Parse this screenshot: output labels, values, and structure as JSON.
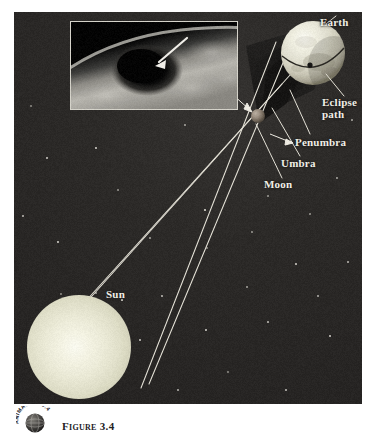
{
  "figure": {
    "domain": "diagram",
    "background_color": "#2a2826",
    "page_color": "#ffffff"
  },
  "labels": [
    {
      "id": "earth",
      "text": "Earth",
      "x": 320,
      "y": 16,
      "align": "left"
    },
    {
      "id": "eclipse_path",
      "text": "Eclipse\npath",
      "x": 322,
      "y": 96,
      "align": "left"
    },
    {
      "id": "penumbra",
      "text": "Penumbra",
      "x": 295,
      "y": 136,
      "align": "left"
    },
    {
      "id": "umbra",
      "text": "Umbra",
      "x": 281,
      "y": 157,
      "align": "left"
    },
    {
      "id": "moon",
      "text": "Moon",
      "x": 264,
      "y": 178,
      "align": "left"
    },
    {
      "id": "sun",
      "text": "Sun",
      "x": 106,
      "y": 288,
      "align": "left"
    }
  ],
  "bodies": {
    "sun": {
      "name": "Sun",
      "cx": 79,
      "cy": 347,
      "r": 52,
      "color": "#eeedd8"
    },
    "moon": {
      "name": "Moon",
      "cx": 258,
      "cy": 116,
      "r": 7,
      "color": "#8b7f71"
    },
    "earth": {
      "name": "Earth",
      "cx": 313,
      "cy": 53,
      "r": 32,
      "color": "#e6e4d5"
    }
  },
  "shadow": {
    "umbra_label": "Umbra",
    "penumbra_label": "Penumbra",
    "eclipse_path_label": "Eclipse path",
    "cone_color": "#1b1a19",
    "ray_color": "#e8e5da",
    "ray_count": 4
  },
  "inset": {
    "name": "satellite-photo-of-umbral-shadow-on-earth",
    "caption_arrow": "white arrow pointing to the dark umbral shadow spot",
    "border_color": "#d8d6cd",
    "x": 70,
    "y": 21,
    "width": 168,
    "height": 89
  },
  "badge": {
    "text_top": "ANIMATION",
    "text_number": "3.4",
    "full_text": "ANIMATION 3.4"
  },
  "caption": {
    "figure_number": "Figure 3.4",
    "text": "Figure 3.4"
  },
  "stars": [
    {
      "x": 31,
      "y": 106,
      "r": 1.1
    },
    {
      "x": 185,
      "y": 125,
      "r": 1.0
    },
    {
      "x": 23,
      "y": 216,
      "r": 1.2
    },
    {
      "x": 58,
      "y": 242,
      "r": 0.9
    },
    {
      "x": 118,
      "y": 190,
      "r": 0.8
    },
    {
      "x": 150,
      "y": 238,
      "r": 1.0
    },
    {
      "x": 162,
      "y": 296,
      "r": 0.9
    },
    {
      "x": 205,
      "y": 210,
      "r": 0.8
    },
    {
      "x": 207,
      "y": 248,
      "r": 1.0
    },
    {
      "x": 247,
      "y": 287,
      "r": 1.1
    },
    {
      "x": 268,
      "y": 322,
      "r": 0.9
    },
    {
      "x": 296,
      "y": 264,
      "r": 1.0
    },
    {
      "x": 310,
      "y": 214,
      "r": 0.8
    },
    {
      "x": 337,
      "y": 178,
      "r": 0.9
    },
    {
      "x": 348,
      "y": 262,
      "r": 1.0
    },
    {
      "x": 330,
      "y": 336,
      "r": 1.1
    },
    {
      "x": 228,
      "y": 372,
      "r": 0.9
    },
    {
      "x": 178,
      "y": 390,
      "r": 0.8
    },
    {
      "x": 286,
      "y": 390,
      "r": 0.9
    },
    {
      "x": 122,
      "y": 300,
      "r": 0.8
    },
    {
      "x": 61,
      "y": 294,
      "r": 1.0
    },
    {
      "x": 96,
      "y": 293,
      "r": 1.1
    },
    {
      "x": 47,
      "y": 158,
      "r": 0.8
    },
    {
      "x": 96,
      "y": 148,
      "r": 0.9
    },
    {
      "x": 268,
      "y": 196,
      "r": 0.8
    },
    {
      "x": 352,
      "y": 120,
      "r": 0.9
    },
    {
      "x": 140,
      "y": 340,
      "r": 0.8
    },
    {
      "x": 206,
      "y": 330,
      "r": 0.9
    },
    {
      "x": 252,
      "y": 232,
      "r": 0.8
    },
    {
      "x": 318,
      "y": 296,
      "r": 0.8
    }
  ]
}
